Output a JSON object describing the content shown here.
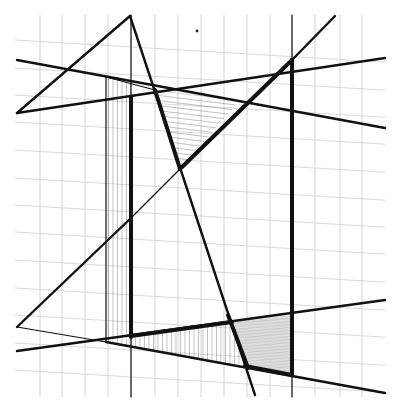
{
  "drawing": {
    "title": "Geometric line composition on grid paper",
    "background_color": "#ffffff",
    "ink_color": "#111111",
    "grid_color": "#c9c9c9",
    "shade_color": "#d8d8d8",
    "bounds": {
      "x0": 15,
      "y0": 15,
      "x1": 385,
      "y1": 397
    },
    "grid": {
      "vertical_x": [
        40,
        62,
        85,
        108,
        131,
        155,
        178,
        201,
        224,
        247,
        270,
        292,
        315,
        340,
        362
      ],
      "horizontal_y_left": [
        40,
        68,
        95,
        122,
        150,
        178,
        205,
        232,
        260,
        288,
        315,
        343,
        370
      ],
      "horizontal_slope": 0.06
    },
    "lines": [
      {
        "id": "top-triangle-left-edge",
        "x1": 130,
        "y1": 16,
        "x2": 17,
        "y2": 113,
        "weight": "med"
      },
      {
        "id": "upper-rising-line",
        "x1": 17,
        "y1": 113,
        "x2": 385,
        "y2": 58,
        "weight": "med"
      },
      {
        "id": "upper-falling-line",
        "x1": 17,
        "y1": 60,
        "x2": 385,
        "y2": 128,
        "weight": "med"
      },
      {
        "id": "steep-diagonal",
        "x1": 130,
        "y1": 16,
        "x2": 255,
        "y2": 395,
        "weight": "med"
      },
      {
        "id": "right-vertical-thick",
        "x1": 292,
        "y1": 60,
        "x2": 292,
        "y2": 375,
        "weight": "thick"
      },
      {
        "id": "right-vertical-thin-top",
        "x1": 292,
        "y1": 15,
        "x2": 292,
        "y2": 60,
        "weight": "thin"
      },
      {
        "id": "right-vertical-thin-bottom",
        "x1": 292,
        "y1": 375,
        "x2": 292,
        "y2": 397,
        "weight": "thin"
      },
      {
        "id": "rising-diagonal-thick",
        "x1": 180,
        "y1": 169,
        "x2": 292,
        "y2": 60,
        "weight": "thick"
      },
      {
        "id": "rising-diagonal-ext",
        "x1": 292,
        "y1": 60,
        "x2": 335,
        "y2": 16,
        "weight": "med"
      },
      {
        "id": "hatched-triangle-left-edge",
        "x1": 155,
        "y1": 90,
        "x2": 180,
        "y2": 169,
        "weight": "thick"
      },
      {
        "id": "left-rect-left",
        "x1": 106,
        "y1": 77,
        "x2": 106,
        "y2": 342,
        "weight": "thin"
      },
      {
        "id": "left-rect-top",
        "x1": 106,
        "y1": 77,
        "x2": 155,
        "y2": 90,
        "weight": "thin"
      },
      {
        "id": "inner-vertical-thick",
        "x1": 131,
        "y1": 97,
        "x2": 131,
        "y2": 337,
        "weight": "thick"
      },
      {
        "id": "inner-vertical-thin-bottom",
        "x1": 131,
        "y1": 337,
        "x2": 131,
        "y2": 397,
        "weight": "thin"
      },
      {
        "id": "inner-vertical-thin-top",
        "x1": 131,
        "y1": 15,
        "x2": 131,
        "y2": 97,
        "weight": "thin"
      },
      {
        "id": "lower-left-diagonal",
        "x1": 17,
        "y1": 327,
        "x2": 131,
        "y2": 218,
        "weight": "med"
      },
      {
        "id": "lower-left-diagonal-thin",
        "x1": 131,
        "y1": 218,
        "x2": 180,
        "y2": 169,
        "weight": "thin"
      },
      {
        "id": "lower-rising-line",
        "x1": 17,
        "y1": 351,
        "x2": 385,
        "y2": 300,
        "weight": "med"
      },
      {
        "id": "lower-rising-thick-seg",
        "x1": 131,
        "y1": 336,
        "x2": 232,
        "y2": 322,
        "weight": "thick"
      },
      {
        "id": "lower-falling-line",
        "x1": 17,
        "y1": 327,
        "x2": 106,
        "y2": 342,
        "weight": "thin"
      },
      {
        "id": "lower-falling-line-2",
        "x1": 106,
        "y1": 342,
        "x2": 385,
        "y2": 393,
        "weight": "med"
      },
      {
        "id": "bottom-thick-seg",
        "x1": 245,
        "y1": 366,
        "x2": 292,
        "y2": 375,
        "weight": "thick"
      },
      {
        "id": "steep-diagonal-thick-seg",
        "x1": 228,
        "y1": 315,
        "x2": 248,
        "y2": 368,
        "weight": "thick"
      }
    ],
    "regions": [
      {
        "id": "top-hatched-triangle",
        "points": "155,90 240,100 180,169",
        "fill": "hatch-horizontal"
      },
      {
        "id": "left-hatched-rectangle",
        "points": "106,77 131,82 131,337 106,342",
        "fill": "hatch-vertical"
      },
      {
        "id": "bottom-hatched-triangle",
        "points": "106,342 232,322 245,366",
        "fill": "hatch-vertical"
      },
      {
        "id": "bottom-right-shaded",
        "points": "232,322 292,315 292,375 245,366",
        "fill": "shade"
      }
    ]
  }
}
